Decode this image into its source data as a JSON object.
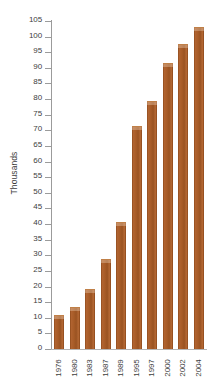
{
  "chart_data": {
    "type": "bar",
    "title": "",
    "subtitle": "",
    "xlabel": "",
    "ylabel": "Thousands",
    "categories": [
      "1976",
      "1980",
      "1983",
      "1987",
      "1989",
      "1995",
      "1997",
      "2000",
      "2002",
      "2004"
    ],
    "values": [
      10.5,
      13,
      19,
      28.5,
      40.3,
      71,
      79,
      91.2,
      97.2,
      102.7
    ],
    "ylim": [
      0,
      105
    ],
    "y_ticks": [
      0,
      5,
      10,
      15,
      20,
      25,
      30,
      35,
      40,
      45,
      50,
      55,
      60,
      65,
      70,
      75,
      80,
      85,
      90,
      95,
      100,
      105
    ],
    "y_tick_labels": [
      "0",
      "5",
      "10",
      "15",
      "20",
      "25",
      "30",
      "35",
      "40",
      "45",
      "50",
      "55",
      "60",
      "65",
      "70",
      "75",
      "80",
      "85",
      "90",
      "95",
      "100",
      "105"
    ],
    "grid": false,
    "legend": null,
    "legend_position": "none",
    "bar_color": "#a85c28",
    "background_color": "#ffffff",
    "axis_color": "#9b9b9b",
    "text_color": "#3d3d3d",
    "annotations": []
  }
}
